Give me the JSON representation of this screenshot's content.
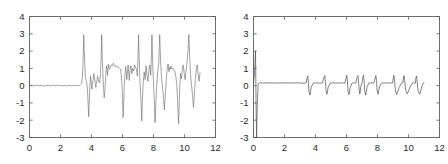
{
  "figure": {
    "background_color": "#ffffff",
    "axis_color": "#5c5c5c",
    "line_color": "#6b6b6b"
  },
  "chart_data": [
    {
      "type": "line",
      "panel": "left",
      "title": "",
      "xlabel": "",
      "ylabel": "",
      "xlim": [
        0,
        12
      ],
      "ylim": [
        -3,
        4
      ],
      "xticks": [
        0,
        2,
        4,
        6,
        8,
        10,
        12
      ],
      "yticks": [
        -3,
        -2,
        -1,
        0,
        1,
        2,
        3,
        4
      ],
      "xticklabels": [
        "0",
        "2",
        "4",
        "6",
        "8",
        "10",
        "12"
      ],
      "yticklabels": [
        "-3",
        "-2",
        "-1",
        "0",
        "1",
        "2",
        "3",
        "4"
      ],
      "grid": false,
      "legend": null,
      "annotations": [],
      "description": "Noisy ECG-like signal: flat near-zero baseline with small ripple from x=0 to x=3.4, then high-amplitude oscillating segment from x=3.4 to x=11 containing seven tall R-peaks reaching about +3 and deep troughs near -2.2.",
      "series": [
        {
          "name": "noisy ECG",
          "x": [
            0.0,
            0.15,
            0.3,
            0.45,
            0.6,
            0.75,
            0.9,
            1.05,
            1.2,
            1.35,
            1.5,
            1.65,
            1.8,
            1.95,
            2.1,
            2.25,
            2.4,
            2.55,
            2.7,
            2.85,
            3.0,
            3.1,
            3.2,
            3.28,
            3.34,
            3.4,
            3.45,
            3.5,
            3.55,
            3.6,
            3.65,
            3.7,
            3.74,
            3.78,
            3.82,
            3.86,
            3.9,
            3.94,
            3.98,
            4.02,
            4.06,
            4.1,
            4.16,
            4.22,
            4.28,
            4.34,
            4.4,
            4.46,
            4.52,
            4.58,
            4.62,
            4.66,
            4.7,
            4.74,
            4.78,
            4.82,
            4.86,
            4.9,
            4.94,
            4.98,
            5.04,
            5.1,
            5.16,
            5.22,
            5.28,
            5.34,
            5.4,
            5.46,
            5.52,
            5.58,
            5.64,
            5.7,
            5.76,
            5.82,
            5.88,
            5.92,
            5.96,
            6.0,
            6.04,
            6.08,
            6.12,
            6.16,
            6.2,
            6.24,
            6.28,
            6.32,
            6.36,
            6.4,
            6.44,
            6.48,
            6.54,
            6.6,
            6.66,
            6.72,
            6.78,
            6.84,
            6.9,
            6.96,
            7.0,
            7.04,
            7.08,
            7.12,
            7.16,
            7.2,
            7.24,
            7.28,
            7.34,
            7.4,
            7.46,
            7.52,
            7.58,
            7.64,
            7.7,
            7.76,
            7.82,
            7.86,
            7.9,
            7.94,
            7.98,
            8.02,
            8.06,
            8.1,
            8.16,
            8.22,
            8.28,
            8.34,
            8.4,
            8.46,
            8.52,
            8.58,
            8.64,
            8.7,
            8.76,
            8.82,
            8.88,
            8.94,
            9.0,
            9.04,
            9.08,
            9.12,
            9.16,
            9.2,
            9.26,
            9.32,
            9.38,
            9.44,
            9.5,
            9.54,
            9.58,
            9.62,
            9.66,
            9.7,
            9.74,
            9.8,
            9.86,
            9.92,
            9.98,
            10.04,
            10.1,
            10.16,
            10.22,
            10.28,
            10.34,
            10.4,
            10.46,
            10.52,
            10.58,
            10.64,
            10.7,
            10.76,
            10.82,
            10.88,
            10.94,
            11.0
          ],
          "y": [
            0.0,
            0.02,
            -0.02,
            0.03,
            -0.01,
            0.02,
            -0.03,
            0.01,
            0.02,
            -0.02,
            0.03,
            -0.01,
            0.01,
            0.02,
            -0.02,
            0.01,
            -0.01,
            0.02,
            -0.02,
            0.01,
            0.0,
            0.02,
            -0.02,
            0.05,
            0.1,
            0.35,
            1.2,
            2.95,
            1.6,
            0.55,
            0.3,
            0.1,
            -0.25,
            -1.0,
            -1.8,
            -0.8,
            0.1,
            0.55,
            0.2,
            -0.2,
            0.05,
            0.35,
            0.7,
            0.3,
            -0.1,
            0.25,
            0.55,
            0.25,
            0.15,
            0.7,
            1.6,
            2.95,
            1.5,
            0.55,
            -0.15,
            -0.7,
            -0.3,
            0.25,
            0.85,
            1.15,
            0.6,
            1.25,
            0.95,
            1.05,
            1.2,
            1.15,
            1.3,
            1.2,
            1.1,
            1.15,
            1.05,
            1.1,
            1.05,
            1.0,
            0.95,
            0.6,
            0.1,
            -0.55,
            -1.85,
            -0.9,
            0.15,
            0.65,
            1.1,
            0.8,
            0.35,
            0.85,
            1.2,
            0.75,
            0.3,
            0.85,
            1.15,
            0.7,
            1.0,
            0.85,
            1.2,
            1.05,
            0.95,
            0.55,
            1.7,
            2.95,
            1.4,
            0.4,
            -0.3,
            -1.0,
            -2.05,
            -0.95,
            0.2,
            0.8,
            0.35,
            1.15,
            0.6,
            0.25,
            0.9,
            1.2,
            0.6,
            1.6,
            2.95,
            1.5,
            0.45,
            -0.25,
            -1.0,
            -2.15,
            -0.9,
            0.2,
            0.85,
            1.25,
            2.95,
            1.4,
            0.45,
            -0.1,
            -0.65,
            -1.4,
            -0.6,
            0.3,
            0.95,
            1.25,
            0.8,
            1.05,
            0.95,
            1.15,
            1.05,
            0.95,
            1.0,
            0.95,
            0.8,
            0.55,
            0.05,
            -0.6,
            -1.45,
            -2.2,
            -1.1,
            0.0,
            0.7,
            0.4,
            1.0,
            1.2,
            0.7,
            0.35,
            0.9,
            1.3,
            1.95,
            2.95,
            1.5,
            0.5,
            -0.05,
            -0.55,
            -1.25,
            -0.5,
            0.35,
            0.95,
            1.2,
            0.65,
            0.25,
            0.75,
            1.15,
            0.55,
            -0.1,
            -0.75,
            -1.55,
            -0.6,
            0.25,
            0.85,
            1.2,
            0.7,
            1.95,
            2.95,
            1.45,
            0.55,
            0.15,
            0.35
          ]
        }
      ]
    },
    {
      "type": "line",
      "panel": "right",
      "title": "",
      "xlabel": "",
      "ylabel": "",
      "xlim": [
        0,
        12
      ],
      "ylim": [
        -3,
        4
      ],
      "xticks": [
        0,
        2,
        4,
        6,
        8,
        10,
        12
      ],
      "yticks": [
        -3,
        -2,
        -1,
        0,
        1,
        2,
        3,
        4
      ],
      "xticklabels": [
        "0",
        "2",
        "4",
        "6",
        "8",
        "10",
        "12"
      ],
      "yticklabels": [
        "-3",
        "-2",
        "-1",
        "0",
        "1",
        "2",
        "3",
        "4"
      ],
      "grid": false,
      "legend": null,
      "annotations": [],
      "description": "Filtered / denoised signal: one tall narrow transient at x=0.15 spanning about -3 to +2, then a nearly flat baseline slightly above zero with small bipolar spikes (amplitude about +0.5 up and -0.5 down) occurring from x=3.4 to x=11.",
      "series": [
        {
          "name": "denoised ECG",
          "x": [
            0.0,
            0.06,
            0.1,
            0.13,
            0.15,
            0.17,
            0.2,
            0.24,
            0.3,
            0.4,
            0.6,
            0.9,
            1.3,
            1.8,
            2.3,
            2.8,
            3.1,
            3.3,
            3.4,
            3.46,
            3.5,
            3.54,
            3.58,
            3.64,
            3.72,
            3.85,
            4.0,
            4.2,
            4.45,
            4.55,
            4.6,
            4.64,
            4.68,
            4.74,
            4.82,
            4.95,
            5.15,
            5.4,
            5.7,
            5.9,
            5.98,
            6.02,
            6.06,
            6.1,
            6.16,
            6.24,
            6.36,
            6.5,
            6.6,
            6.68,
            6.74,
            6.78,
            6.82,
            6.86,
            6.92,
            7.0,
            7.06,
            7.1,
            7.14,
            7.18,
            7.24,
            7.32,
            7.44,
            7.6,
            7.76,
            7.86,
            7.9,
            7.94,
            7.98,
            8.04,
            8.12,
            8.25,
            8.45,
            8.65,
            8.85,
            8.98,
            9.02,
            9.06,
            9.1,
            9.16,
            9.24,
            9.4,
            9.55,
            9.64,
            9.68,
            9.72,
            9.76,
            9.82,
            9.92,
            10.1,
            10.25,
            10.38,
            10.44,
            10.48,
            10.52,
            10.56,
            10.62,
            10.72,
            10.85,
            10.95,
            11.0
          ],
          "y": [
            0.15,
            0.6,
            1.4,
            2.0,
            0.4,
            -1.4,
            -3.0,
            -1.2,
            0.1,
            0.16,
            0.15,
            0.16,
            0.15,
            0.16,
            0.15,
            0.16,
            0.15,
            0.14,
            0.16,
            0.45,
            0.55,
            0.2,
            -0.35,
            -0.55,
            -0.1,
            0.14,
            0.16,
            0.15,
            0.16,
            0.5,
            0.58,
            0.25,
            -0.3,
            -0.5,
            -0.08,
            0.15,
            0.16,
            0.15,
            0.16,
            0.15,
            0.45,
            0.6,
            0.22,
            -0.32,
            -0.52,
            -0.1,
            0.15,
            0.16,
            0.15,
            0.48,
            0.58,
            0.22,
            -0.3,
            -0.48,
            -0.08,
            0.16,
            0.5,
            0.6,
            0.2,
            -0.35,
            -0.55,
            -0.1,
            0.15,
            0.16,
            0.15,
            0.46,
            0.58,
            0.2,
            -0.33,
            -0.5,
            -0.08,
            0.15,
            0.16,
            0.15,
            0.16,
            0.15,
            0.48,
            0.6,
            0.24,
            -0.3,
            -0.52,
            -0.1,
            0.15,
            0.16,
            0.5,
            0.58,
            0.22,
            -0.28,
            -0.48,
            -0.08,
            0.15,
            0.16,
            0.15,
            0.46,
            0.56,
            0.2,
            -0.32,
            -0.5,
            -0.08,
            0.15,
            0.16
          ]
        }
      ]
    }
  ]
}
